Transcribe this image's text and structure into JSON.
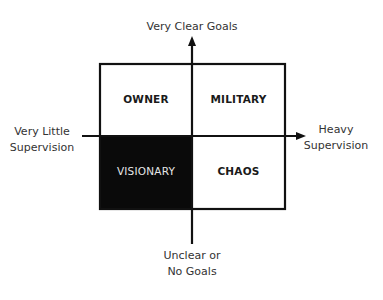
{
  "axes": {
    "top": "Very Clear Goals",
    "bottom_line1": "Unclear or",
    "bottom_line2": "No Goals",
    "left_line1": "Very Little",
    "left_line2": "Supervision",
    "right_line1": "Heavy",
    "right_line2": "Supervision"
  },
  "quadrants": {
    "top_left": "OWNER",
    "top_right": "MILITARY",
    "bottom_left": "VISIONARY",
    "bottom_right": "CHAOS"
  },
  "colors": {
    "line": "#111111",
    "filled_quadrant": "#0a0a0a",
    "filled_text": "#e6e6e6",
    "background": "#ffffff"
  }
}
